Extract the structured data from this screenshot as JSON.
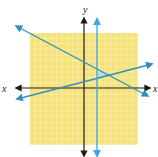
{
  "diagram": {
    "type": "coordinate-plane-system-of-inequalities",
    "axes": {
      "x_label": "x",
      "y_label": "y",
      "x_right_label": "x"
    },
    "grid": {
      "range": [
        -10,
        10
      ],
      "color": "#f5e27a",
      "line_color": "#ffffff"
    },
    "lines": [
      {
        "name": "decreasing-line",
        "color": "#2f8fbf"
      },
      {
        "name": "increasing-line",
        "color": "#2f8fbf"
      },
      {
        "name": "vertical-line",
        "color": "#3aa7dd"
      }
    ],
    "feasible_region": {
      "shape": "triangle",
      "color": "#b9d7ee"
    },
    "colors": {
      "axis": "#1a1a1a",
      "grid_fill": "#f5e27a",
      "line": "#2f8fbf"
    }
  }
}
